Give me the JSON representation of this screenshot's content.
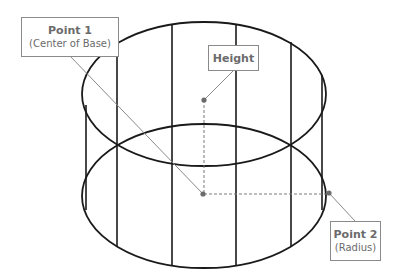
{
  "diagram": {
    "labels": {
      "point1": {
        "title": "Point 1",
        "subtitle": "(Center of Base)"
      },
      "height": {
        "title": "Height"
      },
      "point2": {
        "title": "Point 2",
        "subtitle": "(Radius)"
      }
    },
    "colors": {
      "outline": "#1a1a1a",
      "leader": "#8a8a8a",
      "dashed": "#7a7a7a",
      "dot": "#6b6b6b",
      "label_text": "#6b6b6b",
      "label_border": "#8a8a8a"
    }
  }
}
